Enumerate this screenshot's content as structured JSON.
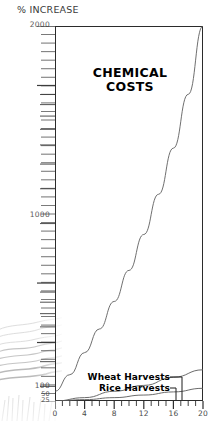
{
  "axis_caption": "% INCREASE",
  "title_line1": "CHEMICAL",
  "title_line2": "COSTS",
  "legend": {
    "wheat": "Wheat Harvests",
    "rice": "Rice Harvests"
  },
  "y_labels": {
    "l2000": "2000",
    "l1000": "1000",
    "l100": "100",
    "l50": "50",
    "l25": "25"
  },
  "chart_data": {
    "type": "line",
    "title": "CHEMICAL COSTS",
    "xlabel": "",
    "ylabel": "% INCREASE",
    "xlim": [
      0,
      20
    ],
    "ylim": [
      25,
      2000
    ],
    "yscale": "log",
    "grid": false,
    "legend_position": "bottom-left-inside",
    "x_ticks": [
      0,
      4,
      8,
      12,
      16,
      20
    ],
    "x_minor_tick_interval": 1,
    "y_ticks": [
      25,
      50,
      100,
      1000,
      2000
    ],
    "series": [
      {
        "name": "CHEMICAL COSTS",
        "color": "#555555",
        "x": [
          0,
          2,
          4,
          6,
          8,
          10,
          12,
          14,
          16,
          18,
          20
        ],
        "values": [
          28,
          34,
          44,
          58,
          80,
          115,
          175,
          280,
          480,
          900,
          2000
        ]
      },
      {
        "name": "Wheat Harvests",
        "color": "#555555",
        "x": [
          0,
          4,
          8,
          12,
          16,
          20
        ],
        "values": [
          25,
          26,
          28,
          30,
          33,
          36
        ]
      },
      {
        "name": "Rice Harvests",
        "color": "#555555",
        "x": [
          0,
          4,
          8,
          12,
          16,
          20
        ],
        "values": [
          25,
          25.4,
          26,
          26.8,
          27.8,
          29
        ]
      }
    ]
  }
}
